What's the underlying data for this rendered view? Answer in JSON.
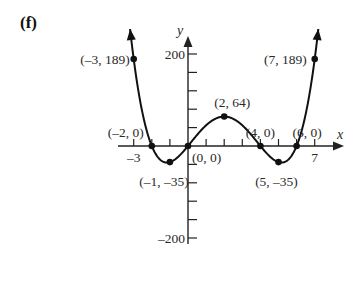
{
  "panel_label": "(f)",
  "chart_data": {
    "type": "line",
    "title": "",
    "xlabel": "x",
    "ylabel": "y",
    "function_points": [
      {
        "x": -3,
        "y": 189,
        "label": "(–3, 189)"
      },
      {
        "x": -2,
        "y": 0,
        "label": "(–2, 0)"
      },
      {
        "x": -1,
        "y": -35,
        "label": "(–1, –35)"
      },
      {
        "x": 0,
        "y": 0,
        "label": "(0, 0)"
      },
      {
        "x": 2,
        "y": 64,
        "label": "(2, 64)"
      },
      {
        "x": 4,
        "y": 0,
        "label": "(4, 0)"
      },
      {
        "x": 5,
        "y": -35,
        "label": "(5, –35)"
      },
      {
        "x": 6,
        "y": 0,
        "label": "(6, 0)"
      },
      {
        "x": 7,
        "y": 189,
        "label": "(7, 189)"
      }
    ],
    "x_tick_labels": [
      {
        "value": -3,
        "label": "–3"
      },
      {
        "value": 7,
        "label": "7"
      }
    ],
    "y_tick_labels": [
      {
        "value": 200,
        "label": "200"
      },
      {
        "value": -200,
        "label": "–200"
      }
    ],
    "x_ticks": [
      -3,
      -2,
      -1,
      1,
      2,
      3,
      4,
      5,
      6,
      7
    ],
    "y_ticks": [
      -200,
      -160,
      -120,
      -80,
      -40,
      40,
      80,
      120,
      160,
      200
    ],
    "xlim": [
      -3.3,
      8.5
    ],
    "ylim": [
      -210,
      235
    ],
    "grid": false,
    "legend": null,
    "ends_with_arrows": true
  }
}
